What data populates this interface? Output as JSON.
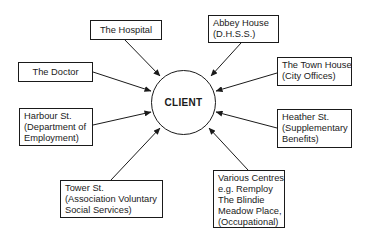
{
  "center": {
    "label": "CLIENT"
  },
  "nodes": [
    {
      "id": "hospital",
      "lines": [
        "The Hospital"
      ]
    },
    {
      "id": "abbey-house",
      "lines": [
        "Abbey House",
        "(D.H.S.S.)"
      ]
    },
    {
      "id": "doctor",
      "lines": [
        "The Doctor"
      ]
    },
    {
      "id": "town-house",
      "lines": [
        "The Town House",
        "(City Offices)"
      ]
    },
    {
      "id": "harbour-st",
      "lines": [
        "Harbour St.",
        "(Department of",
        "Employment)"
      ]
    },
    {
      "id": "heather-st",
      "lines": [
        "Heather St.",
        "(Supplementary",
        "Benefits)"
      ]
    },
    {
      "id": "tower-st",
      "lines": [
        "Tower St.",
        "(Association Voluntary",
        "Social Services)"
      ]
    },
    {
      "id": "various-centres",
      "lines": [
        "Various Centres",
        "e.g. Remploy",
        "The Blindie",
        "Meadow Place,",
        "(Occupational)"
      ]
    }
  ],
  "edges_direction": "all arrows point into CLIENT"
}
